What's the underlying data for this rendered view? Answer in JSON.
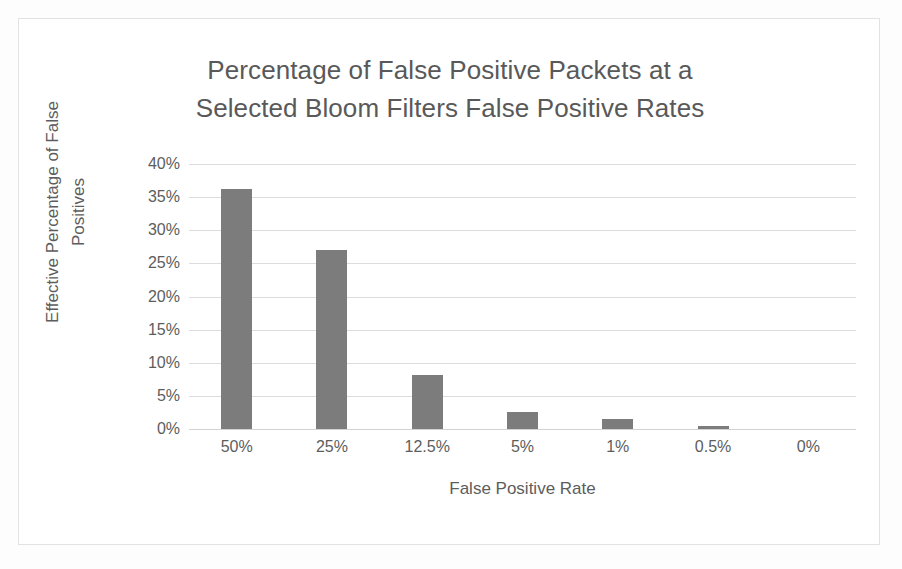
{
  "chart_data": {
    "type": "bar",
    "title": "Percentage of False Positive Packets at a Selected Bloom Filters False Positive Rates",
    "title_lines": [
      "Percentage of False Positive Packets at a",
      "Selected Bloom Filters False Positive Rates"
    ],
    "xlabel": "False Positive Rate",
    "ylabel": "Effective Percentage of False Positives",
    "ylabel_lines": [
      "Effective Percentage of False",
      "Positives"
    ],
    "categories": [
      "50%",
      "25%",
      "12.5%",
      "5%",
      "1%",
      "0.5%",
      "0%"
    ],
    "values": [
      36.3,
      27.0,
      8.1,
      2.6,
      1.5,
      0.4,
      0.0
    ],
    "y_ticks": [
      "40%",
      "35%",
      "30%",
      "25%",
      "20%",
      "15%",
      "10%",
      "5%",
      "0%"
    ],
    "y_tick_values": [
      40,
      35,
      30,
      25,
      20,
      15,
      10,
      5,
      0
    ],
    "ylim": [
      0,
      40
    ],
    "grid": true,
    "legend": false,
    "bar_color": "#7c7c7c",
    "gridline_color": "#dcdcdc",
    "text_color": "#5d5d5d",
    "background_color": "#ffffff",
    "frame_color": "#e2e2e2"
  }
}
